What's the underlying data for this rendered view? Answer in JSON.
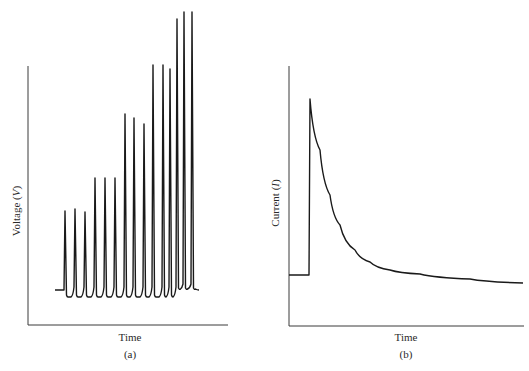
{
  "chart_data": [
    {
      "type": "line",
      "panel": "(a)",
      "title": "",
      "xlabel": "Time",
      "ylabel": "Voltage (V)",
      "ylabel_parts": {
        "text": "Voltage (",
        "var": "V",
        "close": ")"
      },
      "caption": "(a)",
      "grid": false,
      "ticks": false,
      "description": "Repetitive action-potential spikes whose amplitude increases stepwise in groups; final group fires at higher frequency with elevated baseline",
      "spike_groups": [
        {
          "group": 1,
          "spike_x_px": [
            65,
            75,
            85
          ],
          "relative_height": [
            0.31,
            0.32,
            0.31
          ]
        },
        {
          "group": 2,
          "spike_x_px": [
            95,
            105,
            115
          ],
          "relative_height": [
            0.44,
            0.44,
            0.44
          ]
        },
        {
          "group": 3,
          "spike_x_px": [
            125,
            134,
            144
          ],
          "relative_height": [
            0.68,
            0.66,
            0.64
          ]
        },
        {
          "group": 4,
          "spike_x_px": [
            153,
            163,
            170
          ],
          "relative_height": [
            0.86,
            0.86,
            0.84
          ]
        },
        {
          "group": 5,
          "spike_x_px": [
            177,
            184,
            192
          ],
          "relative_height": [
            0.97,
            1.0,
            1.0
          ]
        }
      ],
      "spike_peaks_y_px": [
        211,
        209,
        212,
        178,
        178,
        178,
        114,
        118,
        124,
        65,
        65,
        69,
        19,
        12,
        12
      ],
      "baseline_y_px": 290,
      "hyperpolarized_y_px": 297
    },
    {
      "type": "line",
      "panel": "(b)",
      "title": "",
      "xlabel": "Time",
      "ylabel": "Current (I)",
      "ylabel_parts": {
        "text": "Current (",
        "var": "I",
        "close": ")"
      },
      "caption": "(b)",
      "grid": false,
      "ticks": false,
      "description": "Step rise in current to a sharp peak followed by exponential decay toward a level slightly above the initial baseline",
      "points_px": [
        [
          289,
          275
        ],
        [
          309,
          275
        ],
        [
          310,
          99
        ],
        [
          320,
          150
        ],
        [
          330,
          195
        ],
        [
          340,
          225
        ],
        [
          355,
          250
        ],
        [
          370,
          262
        ],
        [
          390,
          270
        ],
        [
          420,
          274
        ],
        [
          470,
          279
        ],
        [
          523,
          283
        ]
      ]
    }
  ],
  "panels": {
    "a": {
      "xlabel": "Time",
      "caption": "(a)",
      "ylabel_text": "Voltage (",
      "ylabel_var": "V",
      "ylabel_close": ")"
    },
    "b": {
      "xlabel": "Time",
      "caption": "(b)",
      "ylabel_text": "Current (",
      "ylabel_var": "I",
      "ylabel_close": ")"
    }
  },
  "colors": {
    "line": "#1a1a1a",
    "axis": "#3a3a3a",
    "background": "#ffffff"
  }
}
